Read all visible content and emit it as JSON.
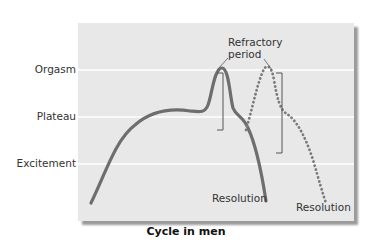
{
  "y_axis": {
    "labels": [
      "Orgasm",
      "Plateau",
      "Excitement"
    ]
  },
  "annotations": {
    "refractory_line1": "Refractory",
    "refractory_line2": "period",
    "resolution_solid": "Resolution",
    "resolution_dotted": "Resolution"
  },
  "caption": "Cycle in men",
  "colors": {
    "panel": "#e8e8e8",
    "curve": "#6e6e6e",
    "gridline": "#ffffff",
    "bracket": "#555555"
  }
}
